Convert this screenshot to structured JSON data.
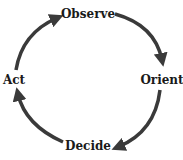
{
  "diagram": {
    "type": "cycle",
    "nodes": [
      {
        "id": "observe",
        "label": "Observe"
      },
      {
        "id": "orient",
        "label": "Orient"
      },
      {
        "id": "decide",
        "label": "Decide"
      },
      {
        "id": "act",
        "label": "Act"
      }
    ],
    "edges": [
      {
        "from": "observe",
        "to": "orient"
      },
      {
        "from": "orient",
        "to": "decide"
      },
      {
        "from": "decide",
        "to": "act"
      },
      {
        "from": "act",
        "to": "observe"
      }
    ],
    "colors": {
      "arrow": "#3a3a3a",
      "text": "#1a1a1a",
      "background": "#ffffff"
    }
  }
}
